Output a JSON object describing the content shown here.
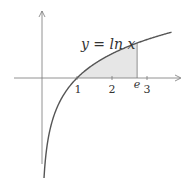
{
  "chart_data": {
    "type": "line",
    "title": "",
    "function": "ln",
    "curve_label": "y = ln x",
    "x_ticks": [
      {
        "value": 1,
        "label": "1"
      },
      {
        "value": 2,
        "label": "2"
      },
      {
        "value": 2.718,
        "label": "e"
      },
      {
        "value": 3,
        "label": "3"
      }
    ],
    "xlim": [
      -1.2,
      4.0
    ],
    "ylim": [
      -2.5,
      1.9
    ],
    "curve_domain": [
      0.02,
      3.7
    ],
    "shaded_region": {
      "from": 1,
      "to": 2.718,
      "description": "area under y=ln x between x=1 and x=e"
    },
    "colors": {
      "curve": "#555555",
      "axis": "#777777",
      "fill": "#e6e6e6"
    }
  }
}
